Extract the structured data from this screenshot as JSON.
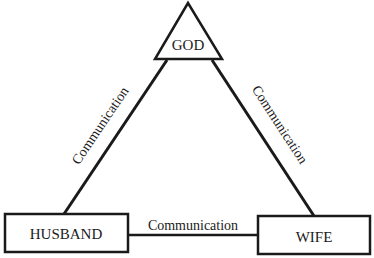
{
  "diagram": {
    "nodes": {
      "god": {
        "label": "GOD",
        "shape": "triangle"
      },
      "husband": {
        "label": "HUSBAND",
        "shape": "rectangle"
      },
      "wife": {
        "label": "WIFE",
        "shape": "rectangle"
      }
    },
    "edges": {
      "husband_god": {
        "label": "Communication"
      },
      "god_wife": {
        "label": "Communication"
      },
      "husband_wife": {
        "label": "Communication"
      }
    },
    "colors": {
      "stroke": "#1a1a1a",
      "background": "#ffffff"
    }
  }
}
